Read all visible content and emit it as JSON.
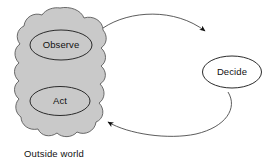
{
  "diagram": {
    "background_color": "#ffffff",
    "cloud": {
      "name": "Outside world",
      "fill_color": "#c9c9c9",
      "stroke_color": "#5a5a5a"
    },
    "caption": {
      "text": "Outside world"
    },
    "nodes": [
      {
        "id": "observe",
        "label": "Observe",
        "shape": "ellipse",
        "fill_color": "#c9c9c9",
        "stroke_color": "#2b2b2b",
        "inside_cloud": true
      },
      {
        "id": "act",
        "label": "Act",
        "shape": "ellipse",
        "fill_color": "#c9c9c9",
        "stroke_color": "#2b2b2b",
        "inside_cloud": true
      },
      {
        "id": "decide",
        "label": "Decide",
        "shape": "ellipse",
        "fill_color": "#ffffff",
        "stroke_color": "#2b2b2b",
        "inside_cloud": false
      }
    ],
    "arrows": [
      {
        "id": "observe-to-decide",
        "from": "observe",
        "to": "decide",
        "direction": "clockwise-top",
        "stroke_color": "#4a4a4a"
      },
      {
        "id": "decide-to-act",
        "from": "decide",
        "to": "act",
        "direction": "clockwise-bottom",
        "stroke_color": "#4a4a4a"
      }
    ]
  }
}
